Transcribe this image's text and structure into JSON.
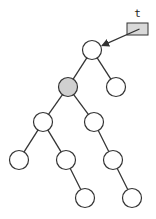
{
  "diagram": {
    "type": "binary-tree",
    "pointer": {
      "label": "t",
      "box": {
        "x": 127,
        "y": 23,
        "w": 21,
        "h": 12,
        "fill": "#d9d9d9"
      },
      "target": "root"
    },
    "node_radius": 9.5,
    "nodes": [
      {
        "id": "root",
        "x": 92,
        "y": 50,
        "fill": "#ffffff"
      },
      {
        "id": "L",
        "x": 68,
        "y": 87,
        "fill": "#d0d0d0",
        "highlighted": true
      },
      {
        "id": "R",
        "x": 116,
        "y": 87,
        "fill": "#ffffff"
      },
      {
        "id": "LL",
        "x": 43,
        "y": 122,
        "fill": "#ffffff"
      },
      {
        "id": "LR",
        "x": 94,
        "y": 122,
        "fill": "#ffffff"
      },
      {
        "id": "LLL",
        "x": 19,
        "y": 160,
        "fill": "#ffffff"
      },
      {
        "id": "LLR",
        "x": 66,
        "y": 160,
        "fill": "#ffffff"
      },
      {
        "id": "LRR",
        "x": 113,
        "y": 160,
        "fill": "#ffffff"
      },
      {
        "id": "LLRR",
        "x": 85,
        "y": 198,
        "fill": "#ffffff"
      },
      {
        "id": "LRRR",
        "x": 132,
        "y": 198,
        "fill": "#ffffff"
      }
    ],
    "edges": [
      [
        "root",
        "L"
      ],
      [
        "root",
        "R"
      ],
      [
        "L",
        "LL"
      ],
      [
        "L",
        "LR"
      ],
      [
        "LL",
        "LLL"
      ],
      [
        "LL",
        "LLR"
      ],
      [
        "LR",
        "LRR"
      ],
      [
        "LLR",
        "LLRR"
      ],
      [
        "LRR",
        "LRRR"
      ]
    ]
  }
}
